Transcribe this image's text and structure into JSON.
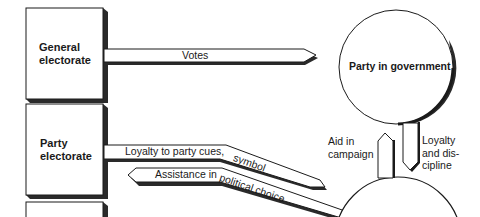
{
  "diagram": {
    "boxes": [
      {
        "id": "general-electorate",
        "line1": "General",
        "line2": "electorate"
      },
      {
        "id": "party-electorate",
        "line1": "Party",
        "line2": "electorate"
      }
    ],
    "circles": [
      {
        "id": "party-in-government",
        "label": "Party in government"
      }
    ],
    "arrows": {
      "votes": "Votes",
      "loyalty_cues_part1": "Loyalty to party cues,",
      "loyalty_cues_part2": "symbol",
      "assistance_part1": "Assistance in",
      "assistance_part2": "political choice",
      "aid_line1": "Aid in",
      "aid_line2": "campaign",
      "loyalty_disc_line1": "Loyalty",
      "loyalty_disc_line2": "and dis-",
      "loyalty_disc_line3": "cipline"
    },
    "colors": {
      "ink": "#1a1a1a",
      "paper": "#ffffff",
      "shadow": "#2a2a2a"
    }
  }
}
